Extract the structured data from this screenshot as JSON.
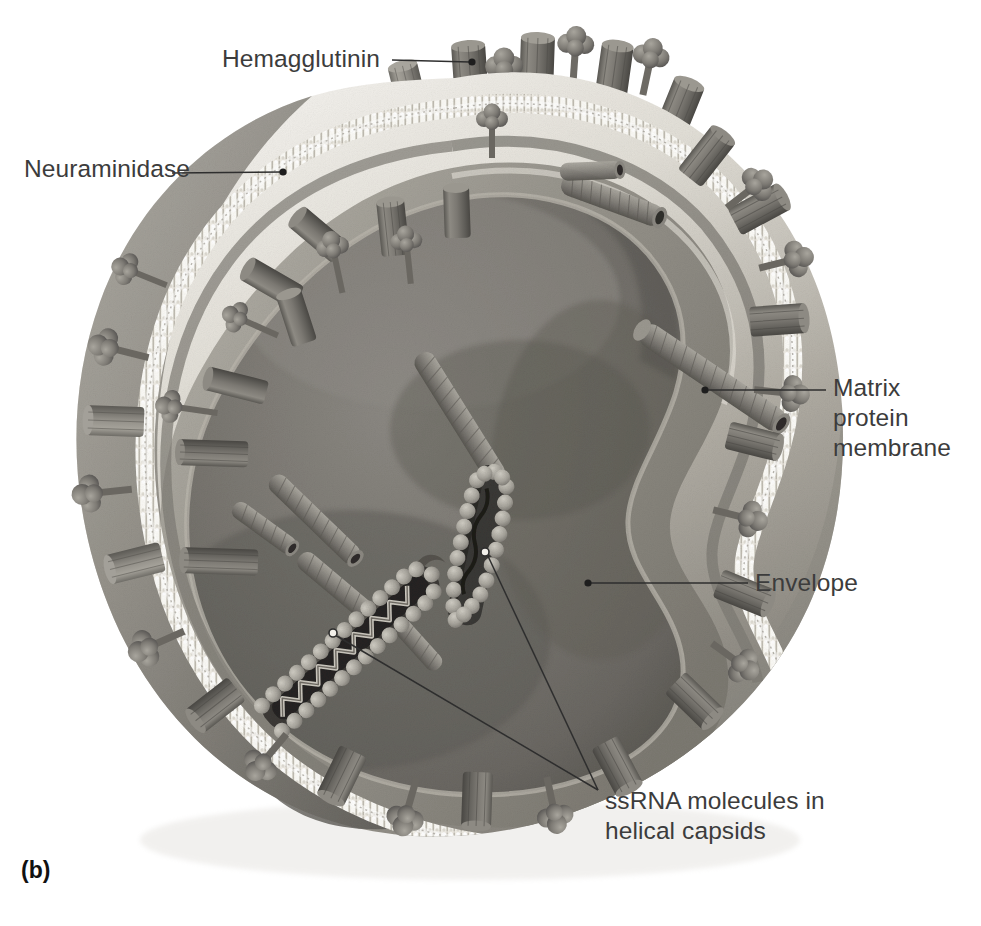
{
  "figure": {
    "panel_letter": "(b)",
    "background_color": "#ffffff",
    "render_style": "grayscale airbrush scientific illustration",
    "width": 981,
    "height": 926
  },
  "labels": {
    "hemagglutinin": {
      "text": "Hemagglutinin",
      "leader_from": [
        392,
        60
      ],
      "leader_to": [
        472,
        62
      ],
      "anchor_dot": [
        472,
        62
      ],
      "points_at": "cylindrical glycoprotein spike"
    },
    "neuraminidase": {
      "text": "Neuraminidase",
      "leader_from": [
        172,
        173
      ],
      "leader_to": [
        283,
        172
      ],
      "anchor_dot": [
        283,
        172
      ],
      "points_at": "mushroom headed glycoprotein spike"
    },
    "matrix_protein_membrane": {
      "text": "Matrix protein\nmembrane",
      "leader_from": [
        826,
        390
      ],
      "leader_to": [
        705,
        390
      ],
      "anchor_dot": [
        705,
        390
      ],
      "points_at": "inner matrix protein layer"
    },
    "envelope": {
      "text": "Envelope",
      "leader_from": [
        748,
        583
      ],
      "leader_to": [
        588,
        583
      ],
      "anchor_dot": [
        588,
        583
      ],
      "points_at": "lipid bilayer beaded membrane"
    },
    "ssrna_helical_capsids": {
      "text": "ssRNA molecules in\nhelical capsids",
      "leader_from": [
        598,
        790
      ],
      "leader_to_a": [
        485,
        552
      ],
      "leader_to_b": [
        333,
        633
      ],
      "anchor_dot_a": [
        485,
        552
      ],
      "anchor_dot_b": [
        333,
        633
      ],
      "points_at": "two opened helical nucleocapsids with beaded RNA"
    }
  },
  "colors": {
    "label_text": "#3c3c3c",
    "panel_letter": "#111111",
    "leader_line": "#2e2e2e",
    "envelope_light": "#efece4",
    "envelope_mid": "#d5d0c4",
    "matrix_layer": "#8f8c84",
    "lumen_dark": "#6e6b66",
    "lumen_mid": "#817e78",
    "spike_body": "#76736c",
    "spike_dark": "#4e4c47",
    "spike_light": "#a6a39b",
    "outer_shell_top": "#e9e7e1",
    "outer_shell_bottom": "#8a877f",
    "rna_bead": "#b9b5ab"
  },
  "structures": {
    "spike_counts": {
      "hemagglutinin_cylinders": 34,
      "neuraminidase_mushrooms": 22
    },
    "interior_capsid_tubes": 8,
    "opened_capsids": 2
  }
}
